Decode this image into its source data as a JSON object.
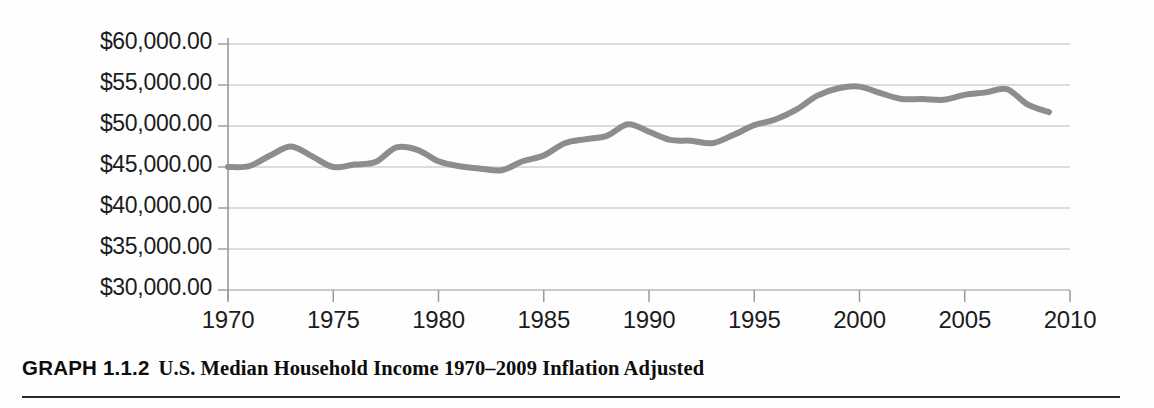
{
  "caption": {
    "number": "GRAPH 1.1.2",
    "text": "U.S. Median Household Income 1970–2009 Inflation Adjusted"
  },
  "chart_data": {
    "type": "line",
    "title": "U.S. Median Household Income 1970–2009 Inflation Adjusted",
    "xlabel": "",
    "ylabel": "",
    "xlim": [
      1970,
      2010
    ],
    "ylim": [
      30000,
      60000
    ],
    "grid": true,
    "legend": null,
    "line_color": "#8d8d8d",
    "line_width": 6,
    "xtick_labels": [
      "1970",
      "1975",
      "1980",
      "1985",
      "1990",
      "1995",
      "2000",
      "2005",
      "2010"
    ],
    "xticks": [
      1970,
      1975,
      1980,
      1985,
      1990,
      1995,
      2000,
      2005,
      2010
    ],
    "ytick_labels": [
      "$60,000.00",
      "$55,000.00",
      "$50,000.00",
      "$45,000.00",
      "$40,000.00",
      "$35,000.00",
      "$30,000.00"
    ],
    "yticks": [
      60000,
      55000,
      50000,
      45000,
      40000,
      35000,
      30000
    ],
    "x": [
      1970,
      1971,
      1972,
      1973,
      1974,
      1975,
      1976,
      1977,
      1978,
      1979,
      1980,
      1981,
      1982,
      1983,
      1984,
      1985,
      1986,
      1987,
      1988,
      1989,
      1990,
      1991,
      1992,
      1993,
      1994,
      1995,
      1996,
      1997,
      1998,
      1999,
      2000,
      2001,
      2002,
      2003,
      2004,
      2005,
      2006,
      2007,
      2008,
      2009
    ],
    "values": [
      45000,
      45100,
      46400,
      47500,
      46300,
      45000,
      45300,
      45600,
      47400,
      47100,
      45700,
      45100,
      44800,
      44600,
      45700,
      46400,
      47900,
      48400,
      48800,
      50200,
      49300,
      48300,
      48200,
      47900,
      48900,
      50100,
      50800,
      52000,
      53700,
      54600,
      54800,
      54000,
      53300,
      53300,
      53200,
      53800,
      54100,
      54500,
      52600,
      51700
    ]
  }
}
